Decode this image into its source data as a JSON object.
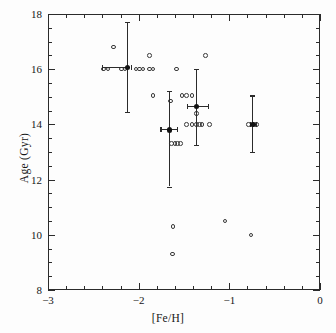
{
  "chart_data": {
    "type": "scatter",
    "title": "",
    "xlabel": "[Fe/H]",
    "ylabel": "Age (Gyr)",
    "xlim": [
      -3,
      0
    ],
    "ylim": [
      8,
      18
    ],
    "xticks": [
      -3,
      -2,
      -1,
      0
    ],
    "xtick_labels": [
      "-3",
      "-2",
      "-1",
      "0"
    ],
    "yticks": [
      8,
      10,
      12,
      14,
      16,
      18
    ],
    "ytick_labels": [
      "8",
      "10",
      "12",
      "14",
      "16",
      "18"
    ],
    "x_minor_interval": 0.2,
    "y_minor_interval": 0.5,
    "grid": false,
    "legend": "none",
    "series": [
      {
        "name": "Individual clusters",
        "marker": "open-circle",
        "points": [
          {
            "x": -2.39,
            "y": 16.0
          },
          {
            "x": -2.34,
            "y": 16.0
          },
          {
            "x": -2.28,
            "y": 16.8
          },
          {
            "x": -2.19,
            "y": 16.0
          },
          {
            "x": -2.15,
            "y": 16.0
          },
          {
            "x": -2.03,
            "y": 16.0
          },
          {
            "x": -1.99,
            "y": 16.0
          },
          {
            "x": -1.95,
            "y": 16.0
          },
          {
            "x": -1.88,
            "y": 16.5
          },
          {
            "x": -1.88,
            "y": 16.0
          },
          {
            "x": -1.84,
            "y": 16.0
          },
          {
            "x": -1.84,
            "y": 15.05
          },
          {
            "x": -1.65,
            "y": 14.85
          },
          {
            "x": -1.64,
            "y": 13.3
          },
          {
            "x": -1.6,
            "y": 13.3
          },
          {
            "x": -1.57,
            "y": 13.3
          },
          {
            "x": -1.54,
            "y": 13.3
          },
          {
            "x": -1.58,
            "y": 16.0
          },
          {
            "x": -1.52,
            "y": 15.05
          },
          {
            "x": -1.47,
            "y": 15.05
          },
          {
            "x": -1.41,
            "y": 15.05
          },
          {
            "x": -1.47,
            "y": 14.0
          },
          {
            "x": -1.41,
            "y": 14.0
          },
          {
            "x": -1.36,
            "y": 14.0
          },
          {
            "x": -1.33,
            "y": 14.0
          },
          {
            "x": -1.3,
            "y": 14.0
          },
          {
            "x": -1.22,
            "y": 14.0
          },
          {
            "x": -1.36,
            "y": 14.4
          },
          {
            "x": -1.26,
            "y": 16.5
          },
          {
            "x": -0.79,
            "y": 14.0
          },
          {
            "x": -0.7,
            "y": 14.0
          },
          {
            "x": -1.62,
            "y": 10.3
          },
          {
            "x": -1.63,
            "y": 9.3
          },
          {
            "x": -1.05,
            "y": 10.5
          },
          {
            "x": -0.76,
            "y": 10.0
          }
        ]
      },
      {
        "name": "Binned means",
        "marker": "filled-circle-with-errorbars",
        "points": [
          {
            "x": -2.12,
            "y": 16.05,
            "xerr_lo": 0.28,
            "xerr_hi": 0.03,
            "yerr_lo": 1.6,
            "yerr_hi": 1.65
          },
          {
            "x": -1.66,
            "y": 13.8,
            "xerr_lo": 0.1,
            "xerr_hi": 0.08,
            "yerr_lo": 2.05,
            "yerr_hi": 1.4
          },
          {
            "x": -1.36,
            "y": 14.65,
            "xerr_lo": 0.11,
            "xerr_hi": 0.12,
            "yerr_lo": 1.4,
            "yerr_hi": 1.35
          },
          {
            "x": -0.74,
            "y": 14.0,
            "xerr_lo": 0.03,
            "xerr_hi": 0.03,
            "yerr_lo": 1.0,
            "yerr_hi": 1.05
          }
        ]
      }
    ]
  }
}
